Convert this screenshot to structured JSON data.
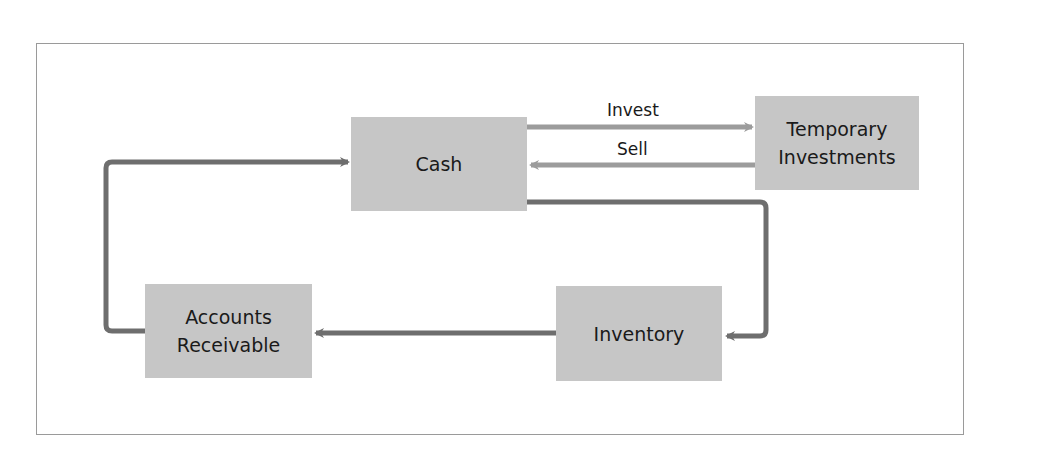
{
  "diagram": {
    "title": "",
    "nodes": {
      "cash": {
        "label": "Cash"
      },
      "temporary_investments": {
        "line1": "Temporary",
        "line2": "Investments"
      },
      "inventory": {
        "label": "Inventory"
      },
      "accounts_receivable": {
        "line1": "Accounts",
        "line2": "Receivable"
      }
    },
    "edges": [
      {
        "from": "Cash",
        "to": "Temporary Investments",
        "label": "Invest"
      },
      {
        "from": "Temporary Investments",
        "to": "Cash",
        "label": "Sell"
      },
      {
        "from": "Cash",
        "to": "Inventory",
        "label": ""
      },
      {
        "from": "Inventory",
        "to": "Accounts Receivable",
        "label": ""
      },
      {
        "from": "Accounts Receivable",
        "to": "Cash",
        "label": ""
      }
    ],
    "edge_labels": {
      "invest": "Invest",
      "sell": "Sell"
    },
    "colors": {
      "node_fill": "#c6c6c6",
      "dark_arrow": "#6e6e6e",
      "light_arrow": "#9c9c9c",
      "frame_border": "#9a9a9a",
      "text": "#1a1a1a"
    }
  }
}
